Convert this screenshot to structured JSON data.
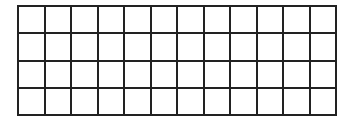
{
  "grid": {
    "rows": 4,
    "columns": 12,
    "line_color": "#222222",
    "cell_color": "#ffffff",
    "cells": [
      [
        "",
        "",
        "",
        "",
        "",
        "",
        "",
        "",
        "",
        "",
        "",
        ""
      ],
      [
        "",
        "",
        "",
        "",
        "",
        "",
        "",
        "",
        "",
        "",
        "",
        ""
      ],
      [
        "",
        "",
        "",
        "",
        "",
        "",
        "",
        "",
        "",
        "",
        "",
        ""
      ],
      [
        "",
        "",
        "",
        "",
        "",
        "",
        "",
        "",
        "",
        "",
        "",
        ""
      ]
    ]
  }
}
